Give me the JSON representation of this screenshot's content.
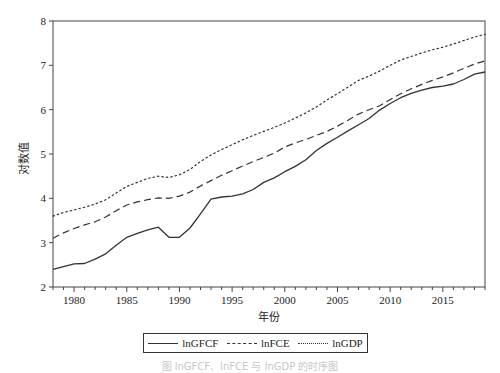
{
  "chart_data": {
    "type": "line",
    "title": "",
    "xlabel": "年份",
    "ylabel": "对数值",
    "xlim": [
      1978,
      2019
    ],
    "ylim": [
      2,
      8
    ],
    "x_ticks": [
      1980,
      1985,
      1990,
      1995,
      2000,
      2005,
      2010,
      2015
    ],
    "y_ticks": [
      2,
      3,
      4,
      5,
      6,
      7,
      8
    ],
    "grid": false,
    "legend_position": "bottom",
    "x": [
      1978,
      1979,
      1980,
      1981,
      1982,
      1983,
      1984,
      1985,
      1986,
      1987,
      1988,
      1989,
      1990,
      1991,
      1992,
      1993,
      1994,
      1995,
      1996,
      1997,
      1998,
      1999,
      2000,
      2001,
      2002,
      2003,
      2004,
      2005,
      2006,
      2007,
      2008,
      2009,
      2010,
      2011,
      2012,
      2013,
      2014,
      2015,
      2016,
      2017,
      2018,
      2019
    ],
    "series": [
      {
        "name": "lnGFCF",
        "style": "solid",
        "values": [
          2.4,
          2.46,
          2.52,
          2.53,
          2.63,
          2.75,
          2.94,
          3.12,
          3.21,
          3.29,
          3.35,
          3.12,
          3.12,
          3.33,
          3.65,
          3.98,
          4.03,
          4.05,
          4.1,
          4.2,
          4.36,
          4.46,
          4.6,
          4.72,
          4.87,
          5.08,
          5.24,
          5.38,
          5.52,
          5.66,
          5.8,
          5.99,
          6.14,
          6.27,
          6.37,
          6.44,
          6.5,
          6.53,
          6.58,
          6.68,
          6.8,
          6.85
        ]
      },
      {
        "name": "lnFCE",
        "style": "dashed",
        "values": [
          3.1,
          3.22,
          3.32,
          3.4,
          3.47,
          3.58,
          3.72,
          3.85,
          3.92,
          3.97,
          4.01,
          4.0,
          4.05,
          4.14,
          4.28,
          4.4,
          4.52,
          4.62,
          4.73,
          4.83,
          4.92,
          5.02,
          5.16,
          5.25,
          5.33,
          5.42,
          5.51,
          5.63,
          5.76,
          5.9,
          6.0,
          6.09,
          6.23,
          6.36,
          6.47,
          6.57,
          6.66,
          6.74,
          6.83,
          6.93,
          7.03,
          7.1
        ]
      },
      {
        "name": "lnGDP",
        "style": "dotted",
        "values": [
          3.6,
          3.68,
          3.74,
          3.8,
          3.87,
          3.97,
          4.12,
          4.27,
          4.36,
          4.45,
          4.5,
          4.47,
          4.53,
          4.65,
          4.83,
          4.98,
          5.1,
          5.21,
          5.32,
          5.42,
          5.51,
          5.6,
          5.7,
          5.81,
          5.93,
          6.06,
          6.22,
          6.36,
          6.51,
          6.66,
          6.76,
          6.87,
          7.0,
          7.12,
          7.2,
          7.28,
          7.35,
          7.41,
          7.48,
          7.56,
          7.64,
          7.7
        ]
      }
    ]
  },
  "legend": {
    "items": [
      {
        "label": "lnGFCF"
      },
      {
        "label": "lnFCE"
      },
      {
        "label": "lnGDP"
      }
    ]
  },
  "caption": "图  lnGFCF、lnFCE 与 lnGDP 的时序图"
}
